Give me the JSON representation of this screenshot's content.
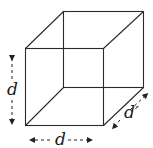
{
  "diagram": {
    "type": "cube",
    "labels": {
      "height": "d",
      "width": "d",
      "depth": "d′"
    },
    "colors": {
      "line": "#2a2a2a",
      "background": "#ffffff"
    }
  }
}
